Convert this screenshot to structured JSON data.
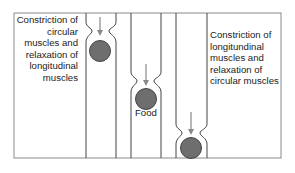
{
  "diagram": {
    "labels": {
      "left": "Constriction of circular muscles and relaxation of longitudinal muscles",
      "right": "Constriction of longitundinal muscles and relaxation of circular muscles",
      "food": "Food"
    },
    "stages": [
      {
        "id": 1,
        "constriction_y": 30,
        "bolus_y": 50
      },
      {
        "id": 2,
        "constriction_y": 80,
        "bolus_y": 99
      },
      {
        "id": 3,
        "constriction_y": 131,
        "bolus_y": 148
      }
    ],
    "colors": {
      "frame": "#888888",
      "tube": "#444444",
      "bolus_fill": "#6e6e6e",
      "bolus_stroke": "#444444",
      "arrow": "#888888"
    }
  }
}
